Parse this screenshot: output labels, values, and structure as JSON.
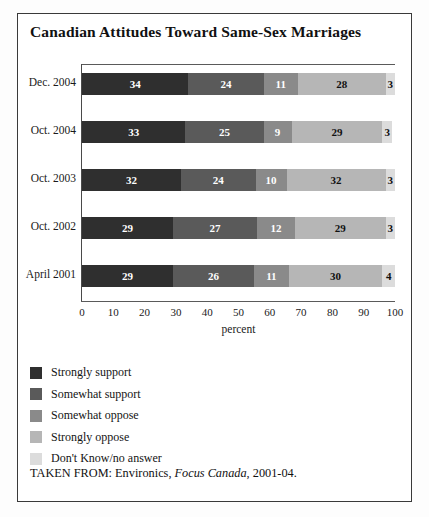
{
  "chart_data": {
    "type": "bar",
    "orientation": "horizontal",
    "stacked": true,
    "title": "Canadian Attitudes Toward Same-Sex Marriages",
    "xlabel": "percent",
    "ylabel": "",
    "xlim": [
      0,
      100
    ],
    "xticks": [
      0,
      10,
      20,
      30,
      40,
      50,
      60,
      70,
      80,
      90,
      100
    ],
    "grid": false,
    "legend_position": "below-left",
    "categories": [
      "Dec. 2004",
      "Oct. 2004",
      "Oct. 2003",
      "Oct. 2002",
      "April 2001"
    ],
    "series": [
      {
        "name": "Strongly support",
        "color": "#2f2f2f",
        "values": [
          34,
          33,
          32,
          29,
          29
        ]
      },
      {
        "name": "Somewhat support",
        "color": "#5a5a5a",
        "values": [
          24,
          25,
          24,
          27,
          26
        ]
      },
      {
        "name": "Somewhat oppose",
        "color": "#8a8a8a",
        "values": [
          11,
          9,
          10,
          12,
          11
        ]
      },
      {
        "name": "Strongly oppose",
        "color": "#b6b6b6",
        "values": [
          28,
          29,
          32,
          29,
          30
        ]
      },
      {
        "name": "Don't Know/no answer",
        "color": "#dcdcdc",
        "values": [
          3,
          3,
          3,
          3,
          4
        ]
      }
    ],
    "source": {
      "prefix": "TAKEN FROM: Environics, ",
      "italic": "Focus Canada",
      "suffix": ", 2001-04."
    }
  }
}
